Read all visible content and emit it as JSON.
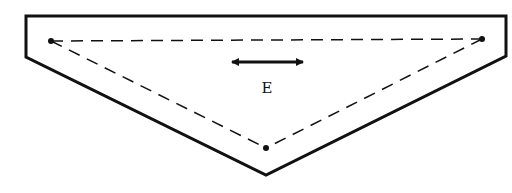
{
  "diagram": {
    "label": "E",
    "colors": {
      "stroke": "#111111",
      "background": "#ffffff"
    },
    "outline": {
      "points": "26,16 506,16 506,56 266,175 26,57"
    },
    "points": [
      {
        "name": "left-vertex",
        "x": 51,
        "y": 41
      },
      {
        "name": "right-vertex",
        "x": 482,
        "y": 39
      },
      {
        "name": "bottom-vertex",
        "x": 266,
        "y": 148
      }
    ],
    "arrow": {
      "x1": 230,
      "y1": 62,
      "x2": 305,
      "y2": 62,
      "type": "double-headed"
    }
  }
}
